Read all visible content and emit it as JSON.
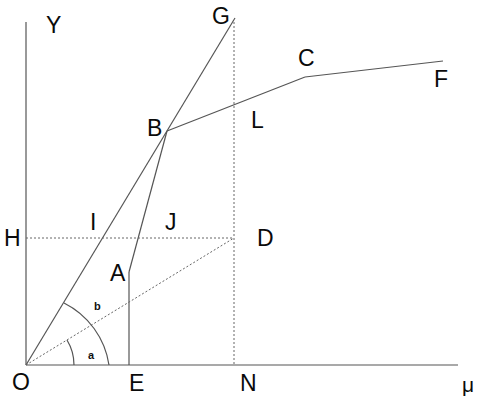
{
  "diagram": {
    "type": "geometric construction / stress-strain style plot",
    "axes": {
      "y_label": "Y",
      "x_label": "μ",
      "origin_label": "O"
    },
    "points": {
      "O": "O",
      "E": "E",
      "N": "N",
      "H": "H",
      "Y": "Y",
      "A": "A",
      "B": "B",
      "C": "C",
      "D": "D",
      "F": "F",
      "G": "G",
      "I": "I",
      "J": "J",
      "L": "L"
    },
    "angles": {
      "a": "a",
      "b": "b"
    },
    "segments": [
      {
        "from": "O",
        "to": "G",
        "style": "solid"
      },
      {
        "from": "E",
        "to": "A",
        "style": "solid"
      },
      {
        "from": "A",
        "to": "B",
        "style": "solid"
      },
      {
        "from": "B",
        "to": "C",
        "style": "solid"
      },
      {
        "from": "C",
        "to": "F",
        "style": "solid"
      },
      {
        "from": "O",
        "to": "Y",
        "style": "solid"
      },
      {
        "from": "O",
        "to": "μ",
        "style": "solid"
      },
      {
        "from": "H",
        "to": "D",
        "style": "dashed"
      },
      {
        "from": "O",
        "to": "D",
        "style": "dashed"
      },
      {
        "from": "G",
        "to": "N",
        "style": "dashed"
      }
    ]
  }
}
